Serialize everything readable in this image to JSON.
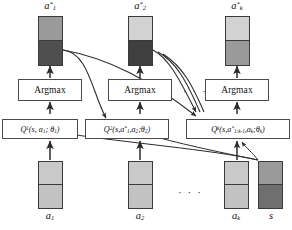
{
  "figure": {
    "type": "diagram",
    "name": "sequential-argmax-q-decomposition",
    "canvas": {
      "width": 292,
      "height": 230,
      "background": "#ffffff"
    }
  },
  "palette": {
    "stroke": "#3a3a3a",
    "light_gray": "#cfcfcf",
    "mid_gray": "#9a9a9a",
    "dark_gray": "#4f4f4f",
    "box_border": "#4a4a4a",
    "text": "#111111"
  },
  "columns": [
    {
      "index": 1,
      "output_label": "a",
      "output_sup": "*",
      "output_sub": "1",
      "argmax_label": "Argmax",
      "q_label": "Q",
      "q_sup": "1",
      "q_args": "(s, a₁; θ₁)",
      "input_label": "a",
      "input_sub": "1",
      "output_top_color": "#9a9a9a",
      "output_bottom_color": "#4f4f4f",
      "input_top_color": "#c9c9c9",
      "input_bottom_color": "#c2c2c2"
    },
    {
      "index": 2,
      "output_label": "a",
      "output_sup": "*",
      "output_sub": "2",
      "argmax_label": "Argmax",
      "q_label": "Q",
      "q_sup": "2",
      "q_args": "(s,a*₁,a₂;θ₂)",
      "input_label": "a",
      "input_sub": "2",
      "output_top_color": "#d2d2d2",
      "output_bottom_color": "#3f3f3f",
      "input_top_color": "#c9c9c9",
      "input_bottom_color": "#c2c2c2"
    },
    {
      "index": 3,
      "output_label": "a",
      "output_sup": "*",
      "output_sub": "k",
      "argmax_label": "Argmax",
      "q_label": "Q",
      "q_sup": "k",
      "q_args": "(s,a*₁:ₖ₋₁,aₖ;θₖ)",
      "input_label": "a",
      "input_sub": "k",
      "output_top_color": "#d2d2d2",
      "output_bottom_color": "#9a9a9a",
      "input_top_color": "#c9c9c9",
      "input_bottom_color": "#c2c2c2"
    }
  ],
  "state": {
    "label": "s",
    "top_color": "#9a9a9a",
    "bottom_color": "#6f6f6f"
  },
  "q_boxes": {
    "q1": {
      "head": "Q",
      "sup": "1",
      "body": "(s, a",
      "sub1": "1",
      "mid": "; θ",
      "sub2": "1",
      "tail": ")"
    },
    "q2": {
      "head": "Q",
      "sup": "2",
      "body": "(s,a",
      "star": "*",
      "sub1": "1",
      "mid": ",a",
      "sub2": "2",
      "theta": ";θ",
      "sub3": "2",
      "tail": ")"
    },
    "qk": {
      "head": "Q",
      "sup": "k",
      "body": "(s,a",
      "star": "*",
      "sub1": "1:k-1",
      "mid": ",a",
      "sub2": "k",
      "theta": ";θ",
      "sub3": "k",
      "tail": ")"
    }
  },
  "ellipses": {
    "top_row": "· · ·",
    "bottom_row": "· · ·"
  },
  "labels": {
    "argmax": "Argmax"
  }
}
